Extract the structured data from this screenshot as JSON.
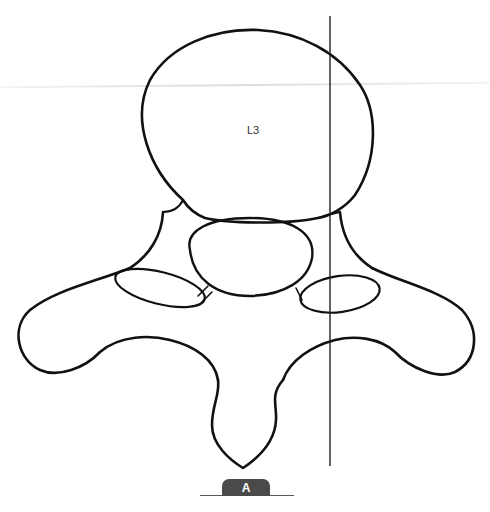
{
  "figure": {
    "vertebra_label": "L3",
    "panel_label": "A",
    "colors": {
      "outline": "#111111",
      "panel_tab_bg": "#4a4a4a",
      "panel_tab_text": "#ffffff",
      "reference_line": "#222222"
    },
    "reference_line": {
      "x": 330,
      "y_top": 16,
      "y_bottom": 466
    }
  }
}
